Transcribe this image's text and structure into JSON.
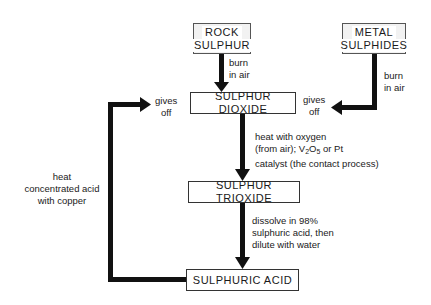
{
  "diagram": {
    "nodes": {
      "rock_sulphur": {
        "line1": "ROCK",
        "line2": "SULPHUR"
      },
      "metal_sulphides": {
        "line1": "METAL",
        "line2": "SULPHIDES"
      },
      "sulphur_dioxide": "SULPHUR DIOXIDE",
      "sulphur_trioxide": "SULPHUR TRIOXIDE",
      "sulphuric_acid": "SULPHURIC ACID"
    },
    "edges": {
      "rock_to_dioxide": {
        "line1": "burn",
        "line2": "in air"
      },
      "metal_to_dioxide": {
        "line1": "burn",
        "line2": "in air",
        "gives1": "gives",
        "gives2": "off"
      },
      "dioxide_to_trioxide": {
        "line1": "heat with oxygen",
        "line2_pre": "(from air); V",
        "sub1": "2",
        "mid": "O",
        "sub2": "5",
        "line2_post": " or Pt",
        "line3": "catalyst (the contact process)"
      },
      "trioxide_to_acid": {
        "line1": "dissolve in 98%",
        "line2": "sulphuric acid, then",
        "line3": "dilute with water"
      },
      "acid_to_dioxide": {
        "line1": "heat",
        "line2": "concentrated acid",
        "line3": "with copper",
        "gives1": "gives",
        "gives2": "off"
      }
    }
  }
}
